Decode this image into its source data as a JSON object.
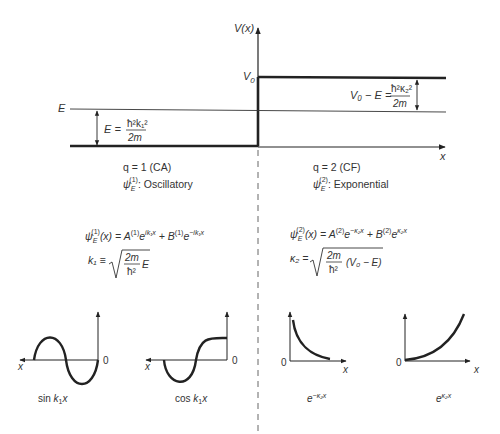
{
  "top_plot": {
    "y_axis_label": "V(x)",
    "x_axis_label": "x",
    "v0_label": "V",
    "v0_sub": "0",
    "e_label": "E",
    "left_energy": {
      "lhs": "E =",
      "numerator": "ħ²k₁²",
      "denominator": "2m"
    },
    "right_energy": {
      "lhs": "V₀ − E =",
      "numerator": "ħ²κ₂²",
      "denominator": "2m"
    }
  },
  "regions": {
    "left": {
      "q_label": "q = 1 (CA)",
      "psi_label": "ψ",
      "psi_sub": "E",
      "psi_sup": "(1)",
      "type_text": ": Oscillatory",
      "wavefunction": "ψ_E^(1)(x) = A^(1) e^(ik₁x) + B^(1) e^(−ik₁x)",
      "k_def": "k₁ ≡ √( (2m/ħ²) E )"
    },
    "right": {
      "q_label": "q = 2 (CF)",
      "psi_label": "ψ",
      "psi_sub": "E",
      "psi_sup": "(2)",
      "type_text": ": Exponential",
      "wavefunction": "ψ_E^(2)(x) = A^(2) e^(−κ₂x) + B^(2) e^(κ₂x)",
      "k_def": "κ₂ = √( (2m/ħ²) (V₀ − E) )"
    }
  },
  "mini_plots": [
    {
      "caption": "sin k₁x",
      "origin": "0",
      "axis": "x"
    },
    {
      "caption": "cos k₁x",
      "origin": "0",
      "axis": "x"
    },
    {
      "caption": "e^(−κ₂x)",
      "origin": "0",
      "axis": "x"
    },
    {
      "caption": "e^(κ₂x)",
      "origin": "0",
      "axis": "x"
    }
  ],
  "formula_text": {
    "left_wf": {
      "psi": "ψ",
      "sub": "E",
      "sup": "(1)",
      "arg": "(x) = A",
      "a_sup": "(1)",
      "e1": "e",
      "e1_sup": "ik₁x",
      "plus": " + B",
      "b_sup": "(1)",
      "e2": "e",
      "e2_sup": "−ik₁x"
    },
    "left_k": {
      "lhs": "k₁ ≡",
      "num": "2m",
      "den": "ħ²",
      "tail": "E"
    },
    "right_wf": {
      "psi": "ψ",
      "sub": "E",
      "sup": "(2)",
      "arg": "(x) = A",
      "a_sup": "(2)",
      "e1": "e",
      "e1_sup": "−κ₂x",
      "plus": " + B",
      "b_sup": "(2)",
      "e2": "e",
      "e2_sup": "κ₂x"
    },
    "right_k": {
      "lhs": "κ₂ =",
      "num": "2m",
      "den": "ħ²",
      "tail": "(V₀ − E)"
    }
  },
  "captions": {
    "sin": {
      "a": "sin ",
      "b": "k",
      "c": "1",
      "d": "x"
    },
    "cos": {
      "a": "cos ",
      "b": "k",
      "c": "1",
      "d": "x"
    },
    "exp_neg": {
      "a": "e",
      "b": "−κ₂x"
    },
    "exp_pos": {
      "a": "e",
      "b": "κ₂x"
    }
  },
  "colors": {
    "ink": "#222222",
    "text": "#333333",
    "background": "#ffffff"
  }
}
